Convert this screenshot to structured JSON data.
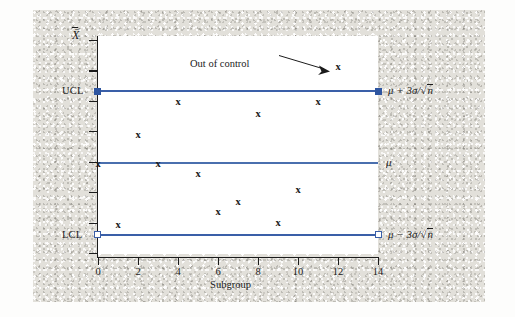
{
  "figure": {
    "background_color": "#e2e0da",
    "panel_color": "#ffffff",
    "line_color": "#3a5fa8",
    "marker_color": "#1b1b1b"
  },
  "chart_data": {
    "type": "scatter",
    "title": "",
    "xlabel": "Subgroup",
    "ylabel": "X̄",
    "xlim": [
      0,
      14
    ],
    "ylim": [
      0,
      10
    ],
    "grid": false,
    "legend_position": "right-inline",
    "xticks": [
      0,
      2,
      4,
      6,
      8,
      10,
      12,
      14
    ],
    "xtick_labels": [
      "0",
      "2",
      "4",
      "6",
      "8",
      "10",
      "12",
      "14"
    ],
    "ytick_count": 8,
    "control_limits": [
      {
        "name": "UCL",
        "axis_label": "UCL",
        "right_label": "μ + 3σ/√n",
        "y": 7.5,
        "marker": "filled-square"
      },
      {
        "name": "Center",
        "axis_label": "",
        "right_label": "μ",
        "y": 4.25,
        "marker": "none"
      },
      {
        "name": "LCL",
        "axis_label": "LCL",
        "right_label": "μ − 3σ/√n",
        "y": 1.0,
        "marker": "open-square"
      }
    ],
    "points": [
      {
        "x": 0,
        "y": 4.25,
        "label": "x",
        "out_of_control": false
      },
      {
        "x": 1,
        "y": 1.45,
        "label": "x",
        "out_of_control": false
      },
      {
        "x": 2,
        "y": 5.55,
        "label": "x",
        "out_of_control": false
      },
      {
        "x": 3,
        "y": 4.25,
        "label": "x",
        "out_of_control": false
      },
      {
        "x": 4,
        "y": 7.05,
        "label": "x",
        "out_of_control": false
      },
      {
        "x": 5,
        "y": 3.8,
        "label": "x",
        "out_of_control": false
      },
      {
        "x": 6,
        "y": 2.05,
        "label": "x",
        "out_of_control": false
      },
      {
        "x": 7,
        "y": 2.5,
        "label": "x",
        "out_of_control": false
      },
      {
        "x": 8,
        "y": 6.5,
        "label": "x",
        "out_of_control": false
      },
      {
        "x": 9,
        "y": 1.55,
        "label": "x",
        "out_of_control": false
      },
      {
        "x": 10,
        "y": 3.05,
        "label": "x",
        "out_of_control": false
      },
      {
        "x": 11,
        "y": 7.05,
        "label": "x",
        "out_of_control": false
      },
      {
        "x": 12,
        "y": 8.6,
        "label": "x",
        "out_of_control": true
      }
    ],
    "annotations": [
      {
        "text": "Out of control",
        "target_x": 12,
        "target_y": 8.6
      }
    ]
  }
}
